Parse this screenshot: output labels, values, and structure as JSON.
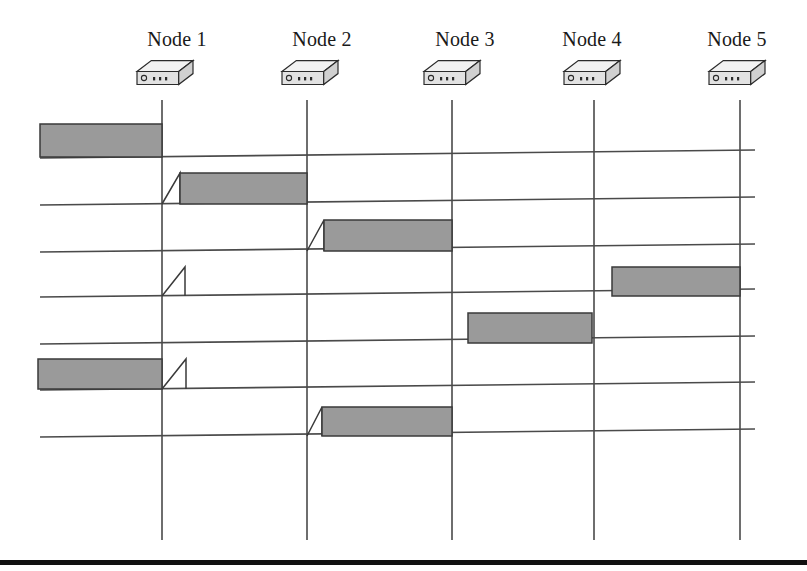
{
  "figure": {
    "canvas": {
      "width": 807,
      "height": 571
    },
    "colors": {
      "bar_fill": "#9a9a9a",
      "bar_stroke": "#3a3a3a",
      "line": "#4a4a4a",
      "device_top": "#f2f2f2",
      "device_front": "#e2e2e2",
      "device_side": "#d0d0d0",
      "device_stroke": "#2b2b2b",
      "footer_rule": "#111111",
      "label_color": "#1a1a1a"
    }
  },
  "nodes": [
    {
      "id": "node-1",
      "label": "Node 1",
      "x": 162,
      "label_x": 177,
      "label_y": 28
    },
    {
      "id": "node-2",
      "label": "Node 2",
      "x": 307,
      "label_x": 322,
      "label_y": 28
    },
    {
      "id": "node-3",
      "label": "Node 3",
      "x": 452,
      "label_x": 465,
      "label_y": 28
    },
    {
      "id": "node-4",
      "label": "Node 4",
      "x": 594,
      "label_x": 592,
      "label_y": 28
    },
    {
      "id": "node-5",
      "label": "Node 5",
      "x": 740,
      "label_x": 737,
      "label_y": 28
    }
  ],
  "device_icons": [
    {
      "id": "device-node-1",
      "cx": 165,
      "cy": 78
    },
    {
      "id": "device-node-2",
      "cx": 310,
      "cy": 78
    },
    {
      "id": "device-node-3",
      "cx": 452,
      "cy": 78
    },
    {
      "id": "device-node-4",
      "cx": 592,
      "cy": 78
    },
    {
      "id": "device-node-5",
      "cx": 737,
      "cy": 78
    }
  ],
  "vertical_lines": {
    "y_top": 100,
    "y_bottom": 540
  },
  "timelines": [
    {
      "id": "timeline-1",
      "index": 1,
      "x1": 40,
      "y1": 158,
      "x2": 755,
      "y2": 150
    },
    {
      "id": "timeline-2",
      "index": 2,
      "x1": 40,
      "y1": 205,
      "x2": 755,
      "y2": 197
    },
    {
      "id": "timeline-3",
      "index": 3,
      "x1": 40,
      "y1": 252,
      "x2": 755,
      "y2": 244
    },
    {
      "id": "timeline-4",
      "index": 4,
      "x1": 40,
      "y1": 297,
      "x2": 755,
      "y2": 289
    },
    {
      "id": "timeline-5",
      "index": 5,
      "x1": 40,
      "y1": 344,
      "x2": 755,
      "y2": 336
    },
    {
      "id": "timeline-6",
      "index": 6,
      "x1": 40,
      "y1": 390,
      "x2": 755,
      "y2": 382
    },
    {
      "id": "timeline-7",
      "index": 7,
      "x1": 40,
      "y1": 437,
      "x2": 755,
      "y2": 429
    }
  ],
  "bars": [
    {
      "id": "bar-1-a",
      "timeline": 1,
      "x_start": 40,
      "x_end": 162,
      "y_base": 157,
      "height": 33,
      "ramp": false,
      "label": "row 1 transmission ending at Node 1"
    },
    {
      "id": "bar-2-a",
      "timeline": 2,
      "x_start": 180,
      "x_end": 307,
      "y_base": 204,
      "height": 31,
      "ramp": true,
      "ramp_x": 162,
      "label": "row 2 transmission from Node 1 to Node 2"
    },
    {
      "id": "bar-3-a",
      "timeline": 3,
      "x_start": 324,
      "x_end": 452,
      "y_base": 251,
      "height": 31,
      "ramp": true,
      "ramp_x": 307,
      "label": "row 3 transmission from Node 2 to Node 3"
    },
    {
      "id": "bar-4-a",
      "timeline": 4,
      "x_start": 612,
      "x_end": 740,
      "y_base": 296,
      "height": 29,
      "ramp": false,
      "label": "row 4 transmission from Node 4 to Node 5"
    },
    {
      "id": "bar-5-a",
      "timeline": 5,
      "x_start": 468,
      "x_end": 592,
      "y_base": 343,
      "height": 30,
      "ramp": false,
      "label": "row 5 transmission from Node 3 to Node 4"
    },
    {
      "id": "bar-6-a",
      "timeline": 6,
      "x_start": 38,
      "x_end": 162,
      "y_base": 389,
      "height": 30,
      "ramp": false,
      "label": "row 6 transmission ending at Node 1"
    },
    {
      "id": "bar-7-a",
      "timeline": 7,
      "x_start": 322,
      "x_end": 452,
      "y_base": 436,
      "height": 29,
      "ramp": true,
      "ramp_x": 307,
      "label": "row 7 transmission from Node 2 to Node 3"
    }
  ],
  "ramps_only": [
    {
      "id": "ramp-4-node1",
      "timeline": 4,
      "x_start": 162,
      "x_end": 185,
      "y_base": 296,
      "height": 29,
      "label": "row 4 collision ramp at Node 1"
    },
    {
      "id": "ramp-6-node1",
      "timeline": 6,
      "x_start": 162,
      "x_end": 186,
      "y_base": 389,
      "height": 30,
      "label": "row 6 collision ramp at Node 1"
    }
  ],
  "footer_rule": {
    "y": 560,
    "x1": 0,
    "x2": 807,
    "thickness": 5
  }
}
